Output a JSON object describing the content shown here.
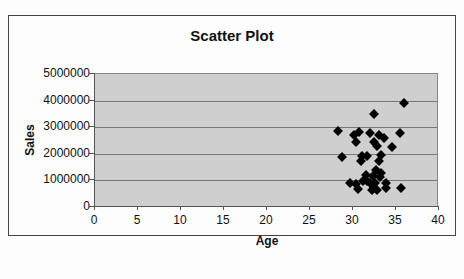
{
  "chart_data": {
    "type": "scatter",
    "title": "Scatter Plot",
    "xlabel": "Age",
    "ylabel": "Sales",
    "xlim": [
      0,
      40
    ],
    "ylim": [
      0,
      5000000
    ],
    "x_ticks": [
      "0",
      "5",
      "10",
      "15",
      "20",
      "25",
      "30",
      "35",
      "40"
    ],
    "y_ticks": [
      "0",
      "1000000",
      "2000000",
      "3000000",
      "4000000",
      "5000000"
    ],
    "grid": "horizontal",
    "legend": "none",
    "marker": "diamond",
    "plot_background": "#cfcfcf",
    "points": [
      {
        "x": 36.0,
        "y": 3860000
      },
      {
        "x": 32.6,
        "y": 3450000
      },
      {
        "x": 28.4,
        "y": 2820000
      },
      {
        "x": 30.8,
        "y": 2790000
      },
      {
        "x": 30.2,
        "y": 2660000
      },
      {
        "x": 32.1,
        "y": 2730000
      },
      {
        "x": 33.1,
        "y": 2660000
      },
      {
        "x": 33.7,
        "y": 2570000
      },
      {
        "x": 35.6,
        "y": 2730000
      },
      {
        "x": 30.5,
        "y": 2400000
      },
      {
        "x": 32.6,
        "y": 2400000
      },
      {
        "x": 32.9,
        "y": 2270000
      },
      {
        "x": 34.7,
        "y": 2210000
      },
      {
        "x": 28.8,
        "y": 1850000
      },
      {
        "x": 31.2,
        "y": 1890000
      },
      {
        "x": 31.8,
        "y": 1880000
      },
      {
        "x": 31.0,
        "y": 1700000
      },
      {
        "x": 33.4,
        "y": 1930000
      },
      {
        "x": 33.1,
        "y": 1700000
      },
      {
        "x": 32.8,
        "y": 1340000
      },
      {
        "x": 33.4,
        "y": 1250000
      },
      {
        "x": 31.6,
        "y": 1160000
      },
      {
        "x": 32.4,
        "y": 1130000
      },
      {
        "x": 33.3,
        "y": 1090000
      },
      {
        "x": 31.3,
        "y": 950000
      },
      {
        "x": 29.8,
        "y": 850000
      },
      {
        "x": 30.5,
        "y": 830000
      },
      {
        "x": 31.7,
        "y": 950000
      },
      {
        "x": 32.1,
        "y": 880000
      },
      {
        "x": 32.7,
        "y": 860000
      },
      {
        "x": 34.0,
        "y": 850000
      },
      {
        "x": 30.7,
        "y": 640000
      },
      {
        "x": 32.3,
        "y": 600000
      },
      {
        "x": 32.9,
        "y": 600000
      },
      {
        "x": 34.0,
        "y": 680000
      },
      {
        "x": 35.7,
        "y": 670000
      },
      {
        "x": 32.6,
        "y": 690000
      }
    ]
  }
}
